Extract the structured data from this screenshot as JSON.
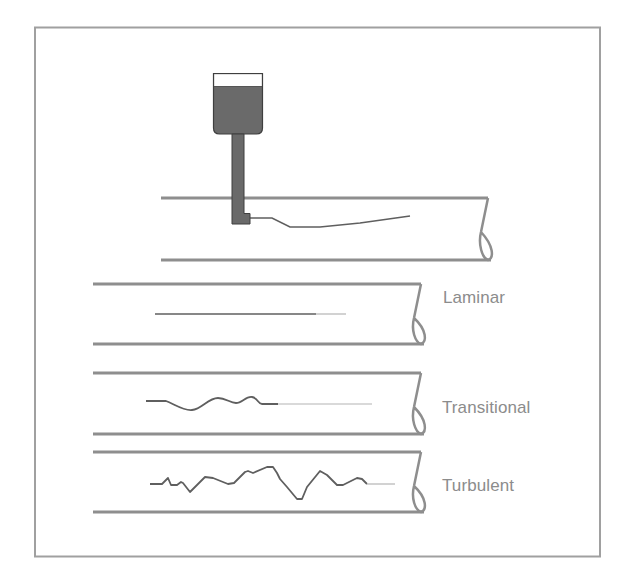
{
  "diagram": {
    "colors": {
      "frame": "#9a9a9a",
      "pipe": "#8e8e8e",
      "dye_dark": "#5f5f5f",
      "dye_light": "#b4b4b4",
      "reservoir_fill": "#6a6a6a",
      "reservoir_outline": "#3f3f3f",
      "label": "#8c8c8c"
    },
    "apparatus": {
      "name": "Dye injector with reservoir"
    },
    "regimes": [
      {
        "id": "laminar",
        "label": "Laminar"
      },
      {
        "id": "transitional",
        "label": "Transitional"
      },
      {
        "id": "turbulent",
        "label": "Turbulent"
      }
    ]
  }
}
